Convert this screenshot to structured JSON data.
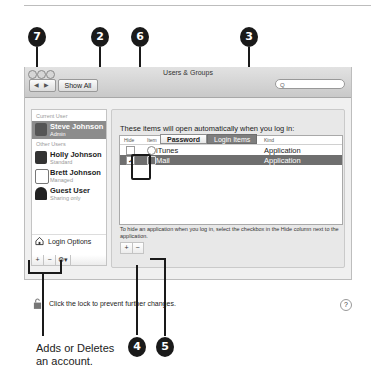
{
  "window": {
    "title": "Users & Groups",
    "nav_label": "◀ ▶",
    "show_all_label": "Show All",
    "search_placeholder": "Q"
  },
  "sidebar": {
    "current_header": "Current User",
    "other_header": "Other Users",
    "users": [
      {
        "name": "Steve Johnson",
        "role": "Admin",
        "selected": true
      },
      {
        "name": "Holly Johnson",
        "role": "Standard"
      },
      {
        "name": "Brett Johnson",
        "role": "Managed"
      },
      {
        "name": "Guest User",
        "role": "Sharing only"
      }
    ],
    "login_options_label": "Login Options",
    "add_label": "+",
    "remove_label": "−",
    "action_label": "⚙▾"
  },
  "tabs": [
    {
      "label": "Password",
      "active": false
    },
    {
      "label": "Login Items",
      "active": true
    }
  ],
  "login_items": {
    "intro": "These items will open automatically when you log in:",
    "columns": [
      "Hide",
      "Item",
      "Kind"
    ],
    "rows": [
      {
        "hide": false,
        "item": "iTunes",
        "kind": "Application",
        "selected": false
      },
      {
        "hide": true,
        "item": "Mail",
        "kind": "Application",
        "selected": true
      }
    ],
    "hint": "To hide an application when you log in, select the checkbox in the Hide column next to the application.",
    "add_label": "+",
    "remove_label": "−"
  },
  "footer": {
    "lock_text": "Click the lock to prevent further changes.",
    "help_label": "?"
  },
  "callouts": {
    "c7": "7",
    "c2": "2",
    "c6": "6",
    "c3": "3",
    "c4": "4",
    "c5": "5",
    "caption_line1": "Adds or Deletes",
    "caption_line2": "an account."
  }
}
